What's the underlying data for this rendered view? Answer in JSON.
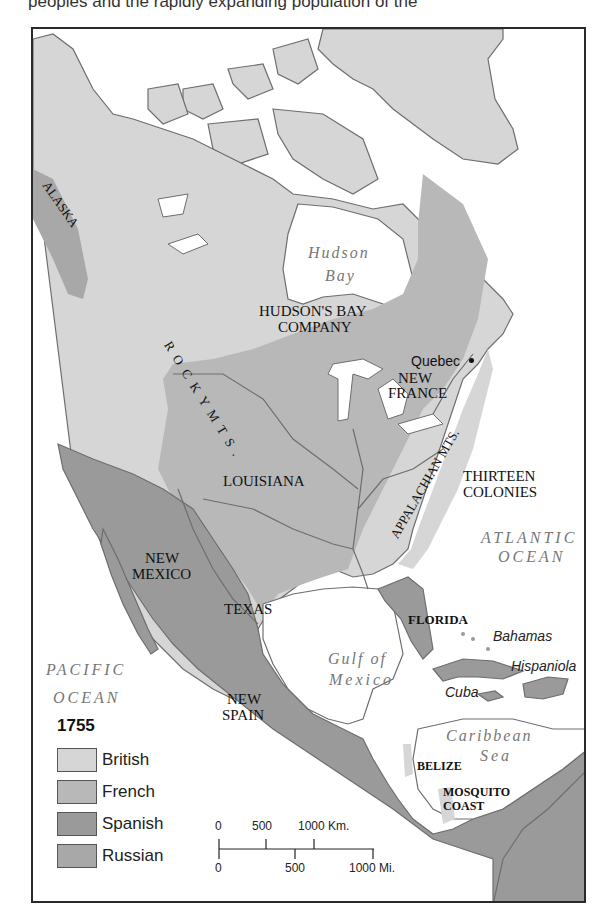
{
  "page": {
    "top_text": "peoples and the rapidly expanding population of the"
  },
  "map": {
    "year": "1755",
    "colors": {
      "british": "#d6d6d6",
      "french": "#b8b8b8",
      "spanish": "#9a9a9a",
      "russian": "#a8a8a8",
      "water": "#ffffff",
      "border": "#6e6e6e"
    },
    "regions": {
      "alaska": "ALASKA",
      "hudsons_bay_company_1": "HUDSON'S BAY",
      "hudsons_bay_company_2": "COMPANY",
      "new_france_1": "NEW",
      "new_france_2": "FRANCE",
      "louisiana": "LOUISIANA",
      "thirteen_colonies_1": "THIRTEEN",
      "thirteen_colonies_2": "COLONIES",
      "new_mexico_1": "NEW",
      "new_mexico_2": "MEXICO",
      "texas": "TEXAS",
      "florida": "FLORIDA",
      "new_spain_1": "NEW",
      "new_spain_2": "SPAIN",
      "belize": "BELIZE",
      "mosquito_coast_1": "MOSQUITO",
      "mosquito_coast_2": "COAST"
    },
    "water_bodies": {
      "hudson_bay_1": "Hudson",
      "hudson_bay_2": "Bay",
      "atlantic_1": "ATLANTIC",
      "atlantic_2": "OCEAN",
      "pacific_1": "PACIFIC",
      "pacific_2": "OCEAN",
      "gulf_1": "Gulf of",
      "gulf_2": "Mexico",
      "caribbean_1": "Caribbean",
      "caribbean_2": "Sea"
    },
    "places": {
      "quebec": "Quebec",
      "bahamas": "Bahamas",
      "hispaniola": "Hispaniola",
      "cuba": "Cuba"
    },
    "mountains": {
      "rocky": "R O C K Y   M T S .",
      "appalachian": "APPALACHIAN MTS."
    },
    "legend": {
      "title": "1755",
      "items": [
        {
          "label": "British",
          "color": "#d6d6d6"
        },
        {
          "label": "French",
          "color": "#b8b8b8"
        },
        {
          "label": "Spanish",
          "color": "#9a9a9a"
        },
        {
          "label": "Russian",
          "color": "#a8a8a8"
        }
      ]
    },
    "scale": {
      "km_labels": [
        "0",
        "500",
        "1000 Km."
      ],
      "mi_labels": [
        "0",
        "500",
        "1000 Mi."
      ]
    }
  }
}
